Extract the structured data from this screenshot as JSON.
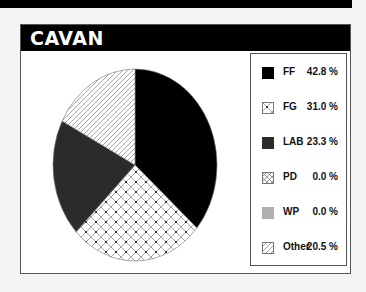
{
  "chart_data": {
    "type": "pie",
    "title": "CAVAN",
    "categories": [
      "FF",
      "FG",
      "LAB",
      "PD",
      "WP",
      "Other"
    ],
    "values": [
      42.8,
      31.0,
      23.3,
      0.0,
      0.0,
      20.5
    ],
    "value_labels": [
      "42.8 %",
      "31.0 %",
      "23.3 %",
      "0.0 %",
      "0.0 %",
      "20.5 %"
    ],
    "fills": [
      "solid-black",
      "crosshatch-dotted",
      "solid-dark-gray",
      "crosshatch",
      "solid-light-gray",
      "diagonal-hatch"
    ],
    "colors": [
      "#000000",
      "#ffffff",
      "#2b2b2b",
      "#ffffff",
      "#b0b0b0",
      "#ffffff"
    ],
    "legend_position": "right",
    "start_angle": "12 o'clock",
    "direction": "clockwise"
  },
  "header": {
    "title": "CAVAN"
  },
  "legend": {
    "items": [
      {
        "label": "FF",
        "value": "42.8 %"
      },
      {
        "label": "FG",
        "value": "31.0 %"
      },
      {
        "label": "LAB",
        "value": "23.3 %"
      },
      {
        "label": "PD",
        "value": "0.0 %"
      },
      {
        "label": "WP",
        "value": "0.0 %"
      },
      {
        "label": "Other",
        "value": "20.5 %"
      }
    ]
  }
}
